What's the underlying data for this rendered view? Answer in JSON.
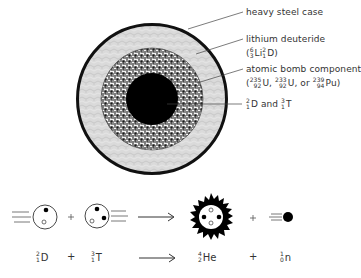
{
  "diagram": {
    "type": "hydrogen bomb cross-section and D-T fusion reaction",
    "colors": {
      "case": "#111111",
      "lithium_layer": "#d9d9d9",
      "fission_layer": "#6f6f6f",
      "core": "#000000",
      "text": "#333333"
    },
    "labels": {
      "case": "heavy steel case",
      "lithium": "lithium deuteride",
      "lithium_formula": {
        "open": "(",
        "li": {
          "mass": "6",
          "z": "3",
          "symbol": "Li"
        },
        "d": {
          "mass": "2",
          "z": "1",
          "symbol": "D"
        },
        "close": ")"
      },
      "fission": "atomic bomb component",
      "fission_formula": {
        "open": "(",
        "u235": {
          "mass": "235",
          "z": "92",
          "symbol": "U"
        },
        "sep1": ", ",
        "u233": {
          "mass": "233",
          "z": "92",
          "symbol": "U"
        },
        "sep2": ", or ",
        "pu239": {
          "mass": "239",
          "z": "94",
          "symbol": "Pu"
        },
        "close": ")"
      },
      "core": {
        "d": {
          "mass": "2",
          "z": "1",
          "symbol": "D"
        },
        "and": " and ",
        "t": {
          "mass": "3",
          "z": "1",
          "symbol": "T"
        }
      }
    },
    "reaction": {
      "reactant1": {
        "mass": "2",
        "z": "1",
        "symbol": "D"
      },
      "plus1": "+",
      "reactant2": {
        "mass": "3",
        "z": "1",
        "symbol": "T"
      },
      "product1": {
        "mass": "4",
        "z": "2",
        "symbol": "He"
      },
      "plus2": "+",
      "product2": {
        "mass": "1",
        "z": "0",
        "symbol": "n"
      }
    }
  }
}
